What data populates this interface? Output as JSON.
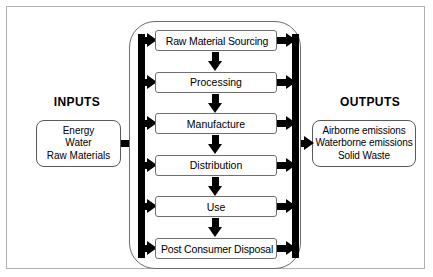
{
  "diagram": {
    "inputs": {
      "heading": "INPUTS",
      "items": [
        "Energy",
        "Water",
        "Raw Materials"
      ]
    },
    "outputs": {
      "heading": "OUTPUTS",
      "items": [
        "Airborne emissions",
        "Waterborne emissions",
        "Solid Waste"
      ]
    },
    "stages": [
      {
        "label": "Raw Material Sourcing"
      },
      {
        "label": "Processing"
      },
      {
        "label": "Manufacture"
      },
      {
        "label": "Distribution"
      },
      {
        "label": "Use"
      },
      {
        "label": "Post Consumer Disposal"
      }
    ],
    "colors": {
      "arrow": "#000000",
      "box_border": "#6f6f6f",
      "container_border": "#6b6b6b",
      "frame_border": "#b0b0b0",
      "background": "#ffffff",
      "text": "#000000"
    }
  }
}
